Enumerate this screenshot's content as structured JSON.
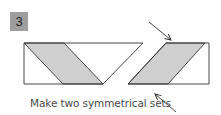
{
  "step": {
    "number": "3",
    "badge_color": "#9e9e9e"
  },
  "caption": "Make two symmetrical sets",
  "colors": {
    "stroke": "#333333",
    "fill": "#cfcfcf"
  },
  "figures": [
    {
      "name": "left-set",
      "outline": "24,43 143,43 103,84 24,84",
      "shaded": "24,43 64,43 103,84 63,84"
    },
    {
      "name": "right-set",
      "outline": "166,43 209,43 209,84 128,84",
      "shaded": "166,43 205,43 168,84 128,84"
    }
  ],
  "arrows": [
    {
      "name": "top-arrow",
      "x1": 149,
      "y1": 22,
      "x2": 171,
      "y2": 40
    },
    {
      "name": "bottom-arrow",
      "x1": 176,
      "y1": 112,
      "x2": 155,
      "y2": 94
    }
  ]
}
